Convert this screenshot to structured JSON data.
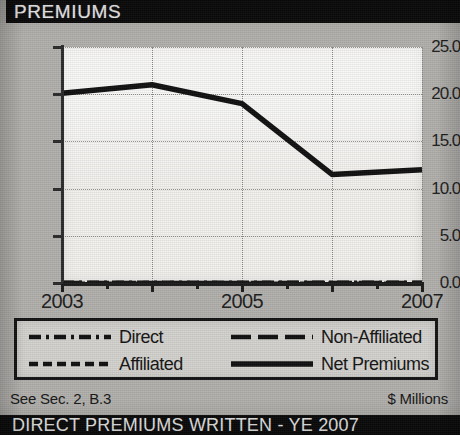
{
  "header": {
    "title": "PREMIUMS"
  },
  "footer": {
    "source_note": "See Sec. 2, B.3",
    "units": "$ Millions",
    "banner": "DIRECT PREMIUMS WRITTEN - YE 2007"
  },
  "legend": {
    "items": [
      {
        "label": "Direct",
        "style": "dash-dot",
        "icon": "dash-dot-line-icon"
      },
      {
        "label": "Non-Affiliated",
        "style": "long-dash",
        "icon": "long-dash-line-icon"
      },
      {
        "label": "Affiliated",
        "style": "short-dash",
        "icon": "short-dash-line-icon"
      },
      {
        "label": "Net Premiums",
        "style": "solid",
        "icon": "solid-line-icon"
      }
    ]
  },
  "colors": {
    "ink": "#141414",
    "paper": "#b2b1ad",
    "plot_bg": "#f3f2ef",
    "bar_bg": "#0a0a0a",
    "grid": "#8e8d89"
  },
  "chart_data": {
    "type": "line",
    "title": "PREMIUMS",
    "xlabel": "",
    "ylabel": "",
    "units": "$ Millions",
    "grid": true,
    "legend_position": "bottom",
    "x": [
      2003,
      2004,
      2005,
      2006,
      2007
    ],
    "xtick_labels": [
      "2003",
      "",
      "2005",
      "",
      "2007"
    ],
    "xlim": [
      2003,
      2007
    ],
    "ylim": [
      0.0,
      25.0
    ],
    "ytick_labels": [
      "25.0",
      "20.0",
      "15.0",
      "10.0",
      "5.0",
      "0.0"
    ],
    "ytick_values": [
      25.0,
      20.0,
      15.0,
      10.0,
      5.0,
      0.0
    ],
    "series": [
      {
        "name": "Net Premiums",
        "style": "solid",
        "values": [
          20.1,
          21.0,
          19.0,
          11.5,
          12.0
        ]
      },
      {
        "name": "Direct",
        "style": "dash-dot",
        "values": [
          0.1,
          0.1,
          0.1,
          0.1,
          0.1
        ]
      },
      {
        "name": "Affiliated",
        "style": "short-dash",
        "values": [
          0.0,
          0.0,
          0.0,
          0.0,
          0.0
        ]
      },
      {
        "name": "Non-Affiliated",
        "style": "long-dash",
        "values": [
          0.05,
          0.05,
          0.05,
          0.05,
          0.05
        ]
      }
    ]
  }
}
